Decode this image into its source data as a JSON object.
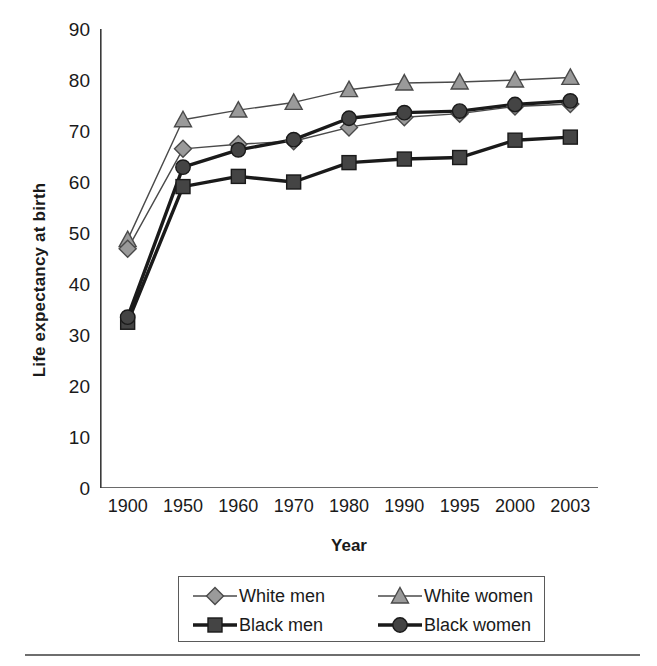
{
  "chart_data": {
    "type": "line",
    "title": "",
    "xlabel": "Year",
    "ylabel": "Life expectancy at birth",
    "categories": [
      "1900",
      "1950",
      "1960",
      "1970",
      "1980",
      "1990",
      "1995",
      "2000",
      "2003"
    ],
    "ylim": [
      0,
      90
    ],
    "yticks": [
      0,
      10,
      20,
      30,
      40,
      50,
      60,
      70,
      80,
      90
    ],
    "grid": false,
    "legend_position": "bottom",
    "series": [
      {
        "name": "White men",
        "marker": "diamond",
        "marker_fill": "#9a9a9a",
        "line_color": "#4a4a4a",
        "line_width": 1.4,
        "values": [
          46.9,
          66.5,
          67.4,
          68.0,
          70.7,
          72.7,
          73.4,
          74.8,
          75.3
        ]
      },
      {
        "name": "White women",
        "marker": "triangle",
        "marker_fill": "#9a9a9a",
        "line_color": "#4a4a4a",
        "line_width": 1.4,
        "values": [
          48.7,
          72.2,
          74.1,
          75.6,
          78.1,
          79.4,
          79.6,
          80.0,
          80.5
        ]
      },
      {
        "name": "Black men",
        "marker": "square",
        "marker_fill": "#444444",
        "line_color": "#1a1a1a",
        "line_width": 3.4,
        "values": [
          32.5,
          59.1,
          61.1,
          60.0,
          63.8,
          64.5,
          64.8,
          68.2,
          68.8
        ]
      },
      {
        "name": "Black women",
        "marker": "circle",
        "marker_fill": "#444444",
        "line_color": "#1a1a1a",
        "line_width": 3.4,
        "values": [
          33.5,
          62.9,
          66.3,
          68.3,
          72.5,
          73.6,
          73.9,
          75.2,
          75.9
        ]
      }
    ]
  },
  "axis": {
    "tick_labels_y": [
      "90",
      "80",
      "70",
      "60",
      "50",
      "40",
      "30",
      "20",
      "10",
      "0"
    ],
    "tick_labels_x": [
      "1900",
      "1950",
      "1960",
      "1970",
      "1980",
      "1990",
      "1995",
      "2000",
      "2003"
    ],
    "x_title": "Year",
    "y_title": "Life expectancy at birth"
  },
  "legend": {
    "entries": [
      {
        "label": "White men",
        "marker": "diamond",
        "fill": "#9a9a9a",
        "line": "#4a4a4a",
        "width": 1.4
      },
      {
        "label": "White women",
        "marker": "triangle",
        "fill": "#9a9a9a",
        "line": "#4a4a4a",
        "width": 1.4
      },
      {
        "label": "Black men",
        "marker": "square",
        "fill": "#444444",
        "line": "#1a1a1a",
        "width": 3.4
      },
      {
        "label": "Black women",
        "marker": "circle",
        "fill": "#444444",
        "line": "#1a1a1a",
        "width": 3.4
      }
    ]
  }
}
